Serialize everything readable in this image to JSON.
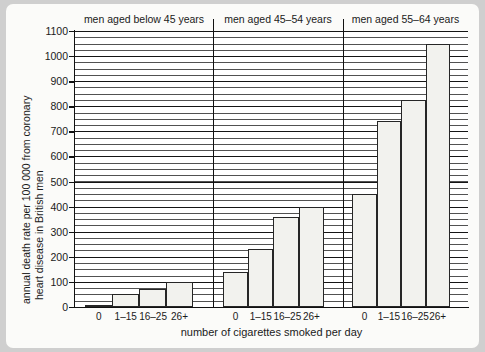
{
  "chart_data": {
    "type": "bar",
    "title": "",
    "xlabel": "number of cigarettes smoked per day",
    "ylabel": "annual death rate per 100 000 from coronary heart disease in British men",
    "ylabel_line1": "annual death rate per 100 000 from coronary",
    "ylabel_line2": "heart disease in British men",
    "ylim": [
      0,
      1100
    ],
    "ytick_step": 100,
    "yticks": [
      0,
      100,
      200,
      300,
      400,
      500,
      600,
      700,
      800,
      900,
      1000,
      1100
    ],
    "ytick_labels": [
      "0",
      "100",
      "200",
      "300",
      "400",
      "500",
      "600",
      "700",
      "800",
      "900",
      "1000",
      "1100"
    ],
    "grid": true,
    "grid_minor_step": 25,
    "legend": "none",
    "categories": [
      "0",
      "1–15",
      "16–25",
      "26+"
    ],
    "groups": [
      {
        "name": "men aged below 45 years",
        "categories": [
          "0",
          "1–15",
          "16–25",
          "26+"
        ],
        "values": [
          10,
          52,
          72,
          100
        ]
      },
      {
        "name": "men aged 45–54 years",
        "categories": [
          "0",
          "1–15",
          "16–25",
          "26+"
        ],
        "values": [
          140,
          232,
          358,
          400
        ]
      },
      {
        "name": "men aged 55–64 years",
        "categories": [
          "0",
          "1–15",
          "16–25",
          "26+"
        ],
        "values": [
          450,
          740,
          825,
          1050
        ]
      }
    ]
  },
  "colors": {
    "page_background": "#cfcfcf",
    "figure_background": "#fbfbf9",
    "plot_background": "#ffffff",
    "axis": "#111111",
    "bar_fill": "#f2f2ee",
    "bar_stroke": "#262626",
    "gridline": "#2b2b2b",
    "text": "#1a1a1a"
  }
}
